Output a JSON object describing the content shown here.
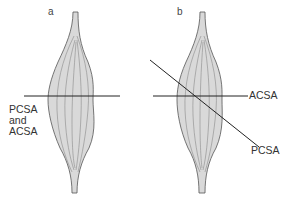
{
  "figure": {
    "panels": [
      {
        "id": "a",
        "label": "a",
        "cut_labels": [
          "PCSA",
          "and",
          "ACSA"
        ],
        "description": "Parallel-fibred muscle: single horizontal cut serves as both PCSA and ACSA"
      },
      {
        "id": "b",
        "label": "b",
        "cut_labels": {
          "horizontal": "ACSA",
          "oblique": "PCSA"
        },
        "description": "Muscle with oblique fibres: horizontal cut is ACSA, oblique cut is PCSA"
      }
    ],
    "colors": {
      "muscle_fill": "#d9d9d9",
      "muscle_outline": "#555555",
      "fibre_lines": "#7a7a7a",
      "cut_lines": "#222222",
      "text": "#333333"
    }
  }
}
